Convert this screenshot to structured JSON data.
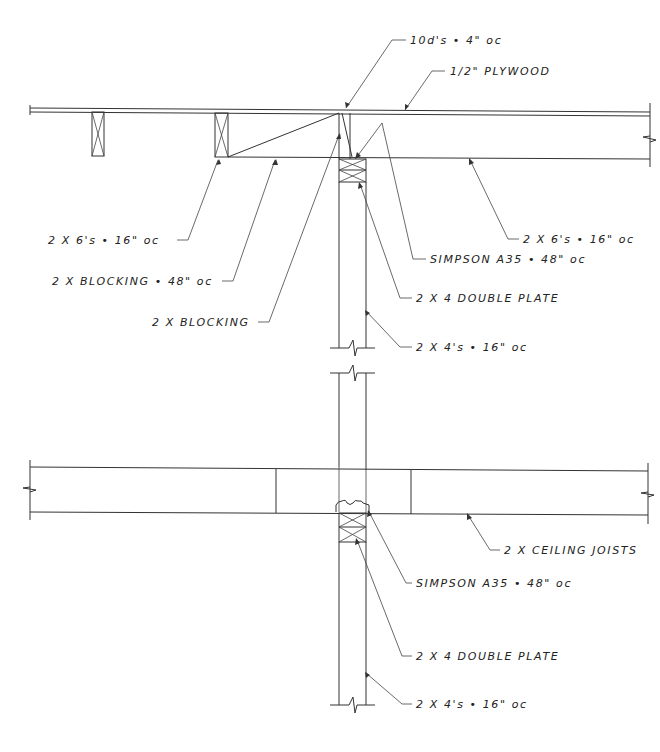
{
  "drawing": {
    "type": "framing section detail",
    "colors": {
      "line": "#333333",
      "text": "#222222",
      "background": "#ffffff"
    }
  },
  "labels": {
    "nails": "10d's • 4\" oc",
    "plywood": "1/2\" PLYWOOD",
    "joists_left": "2 X 6's • 16\" oc",
    "joists_right": "2 X 6's • 16\" oc",
    "blocking_48": "2 X BLOCKING • 48\" oc",
    "blocking": "2 X BLOCKING",
    "simpson_upper": "SIMPSON A35 • 48\" oc",
    "double_plate_upper": "2 X 4 DOUBLE PLATE",
    "studs_upper": "2 X 4's • 16\" oc",
    "ceiling_joists": "2 X CEILING JOISTS",
    "simpson_lower": "SIMPSON A35 • 48\" oc",
    "double_plate_lower": "2 X 4 DOUBLE PLATE",
    "studs_lower": "2 X 4's • 16\" oc"
  }
}
